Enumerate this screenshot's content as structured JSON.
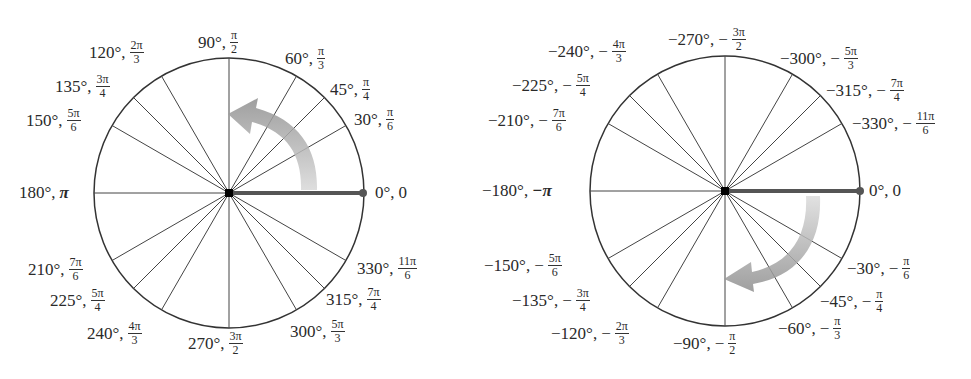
{
  "diagram": {
    "colors": {
      "lines": "#333333",
      "initial_side": "#555555",
      "arrow": "#9a9a9a",
      "center_dot": "#000000"
    },
    "left_circle": {
      "direction": "counterclockwise",
      "labels": [
        {
          "id": "a0",
          "deg": "0°,",
          "rad_plain": "0"
        },
        {
          "id": "a30",
          "deg": "30°,",
          "num": "π",
          "den": "6"
        },
        {
          "id": "a45",
          "deg": "45°,",
          "num": "π",
          "den": "4"
        },
        {
          "id": "a60",
          "deg": "60°,",
          "num": "π",
          "den": "3"
        },
        {
          "id": "a90",
          "deg": "90°,",
          "num": "π",
          "den": "2"
        },
        {
          "id": "a120",
          "deg": "120°,",
          "num": "2π",
          "den": "3"
        },
        {
          "id": "a135",
          "deg": "135°,",
          "num": "3π",
          "den": "4"
        },
        {
          "id": "a150",
          "deg": "150°,",
          "num": "5π",
          "den": "6"
        },
        {
          "id": "a180",
          "deg": "180°,",
          "rad_plain": "π"
        },
        {
          "id": "a210",
          "deg": "210°,",
          "num": "7π",
          "den": "6"
        },
        {
          "id": "a225",
          "deg": "225°,",
          "num": "5π",
          "den": "4"
        },
        {
          "id": "a240",
          "deg": "240°,",
          "num": "4π",
          "den": "3"
        },
        {
          "id": "a270",
          "deg": "270°,",
          "num": "3π",
          "den": "2"
        },
        {
          "id": "a300",
          "deg": "300°,",
          "num": "5π",
          "den": "3"
        },
        {
          "id": "a315",
          "deg": "315°,",
          "num": "7π",
          "den": "4"
        },
        {
          "id": "a330",
          "deg": "330°,",
          "num": "11π",
          "den": "6"
        }
      ]
    },
    "right_circle": {
      "direction": "clockwise",
      "labels": [
        {
          "id": "n0",
          "deg": "0°,",
          "rad_plain": "0"
        },
        {
          "id": "n30",
          "deg": "−30°,",
          "sign": "−",
          "num": "π",
          "den": "6"
        },
        {
          "id": "n45",
          "deg": "−45°,",
          "sign": "−",
          "num": "π",
          "den": "4"
        },
        {
          "id": "n60",
          "deg": "−60°,",
          "sign": "−",
          "num": "π",
          "den": "3"
        },
        {
          "id": "n90",
          "deg": "−90°,",
          "sign": "−",
          "num": "π",
          "den": "2"
        },
        {
          "id": "n120",
          "deg": "−120°,",
          "sign": "−",
          "num": "2π",
          "den": "3"
        },
        {
          "id": "n135",
          "deg": "−135°,",
          "sign": "−",
          "num": "3π",
          "den": "4"
        },
        {
          "id": "n150",
          "deg": "−150°,",
          "sign": "−",
          "num": "5π",
          "den": "6"
        },
        {
          "id": "n180",
          "deg": "−180°,",
          "rad_plain": "−π"
        },
        {
          "id": "n210",
          "deg": "−210°,",
          "sign": "−",
          "num": "7π",
          "den": "6"
        },
        {
          "id": "n225",
          "deg": "−225°,",
          "sign": "−",
          "num": "5π",
          "den": "4"
        },
        {
          "id": "n240",
          "deg": "−240°,",
          "sign": "−",
          "num": "4π",
          "den": "3"
        },
        {
          "id": "n270",
          "deg": "−270°,",
          "sign": "−",
          "num": "3π",
          "den": "2"
        },
        {
          "id": "n300",
          "deg": "−300°,",
          "sign": "−",
          "num": "5π",
          "den": "3"
        },
        {
          "id": "n315",
          "deg": "−315°,",
          "sign": "−",
          "num": "7π",
          "den": "4"
        },
        {
          "id": "n330",
          "deg": "−330°,",
          "sign": "−",
          "num": "11π",
          "den": "6"
        }
      ]
    }
  }
}
